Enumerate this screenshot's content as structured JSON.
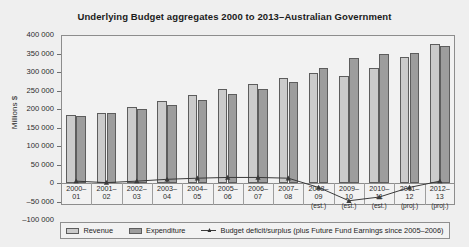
{
  "chart_data": {
    "type": "bar",
    "title": "Underlying Budget aggregates 2000 to 2013–Australian Government",
    "xlabel": "",
    "ylabel": "Millions $",
    "ylim": [
      -100000,
      400000
    ],
    "ytick_labels": [
      "400 000",
      "350 000",
      "300 000",
      "250 000",
      "200 000",
      "150 000",
      "100 000",
      "50 000",
      "0",
      "–50 000",
      "–100 000"
    ],
    "ytick_values": [
      400000,
      350000,
      300000,
      250000,
      200000,
      150000,
      100000,
      50000,
      0,
      -50000,
      -100000
    ],
    "grid": false,
    "legend_position": "bottom",
    "categories": [
      "2000–01",
      "2001–02",
      "2002–03",
      "2003–04",
      "2004–05",
      "2005–06",
      "2006–07",
      "2007–08",
      "2008–09",
      "2009–10",
      "2010–11",
      "2011–12",
      "2012–13"
    ],
    "category_lines": [
      {
        "yr1": "2000–",
        "yr2": "01",
        "note": ""
      },
      {
        "yr1": "2001–",
        "yr2": "02",
        "note": ""
      },
      {
        "yr1": "2002–",
        "yr2": "03",
        "note": ""
      },
      {
        "yr1": "2003–",
        "yr2": "04",
        "note": ""
      },
      {
        "yr1": "2004–",
        "yr2": "05",
        "note": ""
      },
      {
        "yr1": "2005–",
        "yr2": "06",
        "note": ""
      },
      {
        "yr1": "2006–",
        "yr2": "07",
        "note": ""
      },
      {
        "yr1": "2007–",
        "yr2": "08",
        "note": ""
      },
      {
        "yr1": "2008–",
        "yr2": "09",
        "note": "(est.)"
      },
      {
        "yr1": "2009–",
        "yr2": "10",
        "note": "(est.)"
      },
      {
        "yr1": "2010–",
        "yr2": "11",
        "note": "(est.)"
      },
      {
        "yr1": "2011–",
        "yr2": "12",
        "note": "(proj.)"
      },
      {
        "yr1": "2012–",
        "yr2": "13",
        "note": "(proj.)"
      }
    ],
    "series": [
      {
        "name": "Revenue",
        "color": "#cbcbcb",
        "values": [
          185000,
          190000,
          205000,
          222000,
          238000,
          255000,
          268000,
          285000,
          298000,
          290000,
          310000,
          340000,
          375000
        ]
      },
      {
        "name": "Expenditure",
        "color": "#9d9d9d",
        "values": [
          180000,
          190000,
          200000,
          212000,
          225000,
          240000,
          253000,
          272000,
          310000,
          338000,
          348000,
          352000,
          370000
        ]
      },
      {
        "name": "Budget deficit/surplus (plus Future Fund Earnings since 2005–2006)",
        "color": "#3a3a3a",
        "values": [
          5000,
          1000,
          5000,
          10000,
          13000,
          15000,
          15000,
          13000,
          -12000,
          -48000,
          -38000,
          -12000,
          5000
        ]
      }
    ],
    "legend": [
      {
        "label": "Revenue",
        "marker": "swatch",
        "color": "#cbcbcb"
      },
      {
        "label": "Expenditure",
        "marker": "swatch",
        "color": "#9d9d9d"
      },
      {
        "label": "Budget deficit/surplus (plus Future Fund Earnings since 2005–2006)",
        "marker": "line",
        "color": "#3a3a3a"
      }
    ]
  }
}
